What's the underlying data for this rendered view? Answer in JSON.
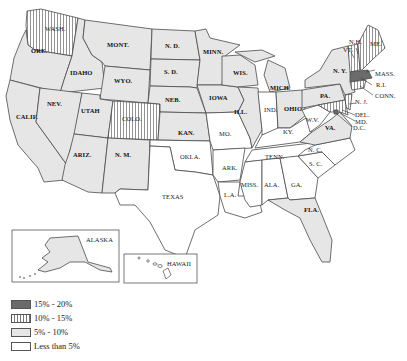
{
  "legend": {
    "items": [
      {
        "label": "15% - 20%",
        "category": "high",
        "fill": "#6b6b6b",
        "pattern": "solid"
      },
      {
        "label": "10% - 15%",
        "category": "mid_high",
        "fill": "#ffffff",
        "pattern": "vertical-stripes"
      },
      {
        "label": "5% - 10%",
        "category": "mid",
        "fill": "#e6e6e6",
        "pattern": "solid"
      },
      {
        "label": "Less than 5%",
        "category": "low",
        "fill": "#ffffff",
        "pattern": "solid"
      }
    ]
  },
  "colors": {
    "high": "#6b6b6b",
    "mid": "#e6e6e6",
    "low": "#ffffff",
    "stripe": "#777777",
    "border": "#4a4a4a"
  },
  "states": [
    {
      "abbr": "WASH.",
      "category": "mid_high",
      "bold": false
    },
    {
      "abbr": "ORE.",
      "category": "mid",
      "bold": true
    },
    {
      "abbr": "CALIF.",
      "category": "mid",
      "bold": true
    },
    {
      "abbr": "IDAHO",
      "category": "mid",
      "bold": true
    },
    {
      "abbr": "NEV.",
      "category": "mid",
      "bold": true
    },
    {
      "abbr": "MONT.",
      "category": "mid",
      "bold": true
    },
    {
      "abbr": "WYO.",
      "category": "mid",
      "bold": true
    },
    {
      "abbr": "UTAH",
      "category": "mid",
      "bold": true
    },
    {
      "abbr": "COLO.",
      "category": "mid_high",
      "bold": false
    },
    {
      "abbr": "ARIZ.",
      "category": "mid",
      "bold": true
    },
    {
      "abbr": "N. M.",
      "category": "mid",
      "bold": true
    },
    {
      "abbr": "N. D.",
      "category": "mid",
      "bold": true
    },
    {
      "abbr": "S. D.",
      "category": "mid",
      "bold": true
    },
    {
      "abbr": "NEB.",
      "category": "mid",
      "bold": true
    },
    {
      "abbr": "KAN.",
      "category": "mid",
      "bold": true
    },
    {
      "abbr": "OKLA.",
      "category": "low",
      "bold": false
    },
    {
      "abbr": "TEXAS",
      "category": "low",
      "bold": false
    },
    {
      "abbr": "MINN.",
      "category": "mid",
      "bold": true
    },
    {
      "abbr": "IOWA",
      "category": "mid",
      "bold": true
    },
    {
      "abbr": "MO.",
      "category": "low",
      "bold": false
    },
    {
      "abbr": "ARK.",
      "category": "low",
      "bold": false
    },
    {
      "abbr": "L.A.",
      "category": "low",
      "bold": false
    },
    {
      "abbr": "WIS.",
      "category": "mid",
      "bold": true
    },
    {
      "abbr": "ILL.",
      "category": "mid",
      "bold": true
    },
    {
      "abbr": "MICH.",
      "category": "mid",
      "bold": true
    },
    {
      "abbr": "IND.",
      "category": "low",
      "bold": false
    },
    {
      "abbr": "OHIO",
      "category": "mid",
      "bold": true
    },
    {
      "abbr": "KY.",
      "category": "low",
      "bold": false
    },
    {
      "abbr": "TENN.",
      "category": "low",
      "bold": false
    },
    {
      "abbr": "MISS.",
      "category": "low",
      "bold": false
    },
    {
      "abbr": "ALA.",
      "category": "low",
      "bold": false
    },
    {
      "abbr": "GA.",
      "category": "low",
      "bold": false
    },
    {
      "abbr": "FLA.",
      "category": "mid",
      "bold": true
    },
    {
      "abbr": "S. C.",
      "category": "low",
      "bold": false
    },
    {
      "abbr": "N. C.",
      "category": "low",
      "bold": false
    },
    {
      "abbr": "VA.",
      "category": "mid",
      "bold": true
    },
    {
      "abbr": "W.V.",
      "category": "low",
      "bold": false
    },
    {
      "abbr": "PA.",
      "category": "mid",
      "bold": true
    },
    {
      "abbr": "N. Y.",
      "category": "mid",
      "bold": true
    },
    {
      "abbr": "N. J.",
      "category": "mid_high",
      "bold": false
    },
    {
      "abbr": "DEL.",
      "category": "mid_high",
      "bold": false
    },
    {
      "abbr": "MD.",
      "category": "mid_high",
      "bold": false
    },
    {
      "abbr": "D.C.",
      "category": "high",
      "bold": false
    },
    {
      "abbr": "CONN.",
      "category": "mid_high",
      "bold": false
    },
    {
      "abbr": "R.I.",
      "category": "mid_high",
      "bold": false
    },
    {
      "abbr": "MASS.",
      "category": "high",
      "bold": false
    },
    {
      "abbr": "VT.",
      "category": "mid_high",
      "bold": false
    },
    {
      "abbr": "N.H.",
      "category": "mid_high",
      "bold": false
    },
    {
      "abbr": "ME.",
      "category": "mid_high",
      "bold": false
    },
    {
      "abbr": "ALASKA",
      "category": "mid",
      "bold": false
    },
    {
      "abbr": "HAWAII",
      "category": "low",
      "bold": false
    }
  ],
  "labels": {
    "wash": "WASH.",
    "ore": "ORE.",
    "calif": "CALIF.",
    "idaho": "IDAHO",
    "nev": "NEV.",
    "mont": "MONT.",
    "wyo": "WYO.",
    "utah": "UTAH",
    "colo": "COLO.",
    "ariz": "ARIZ.",
    "nm": "N. M.",
    "nd": "N. D.",
    "sd": "S. D.",
    "neb": "NEB.",
    "kan": "KAN.",
    "okla": "OKLA.",
    "texas": "TEXAS",
    "minn": "MINN.",
    "iowa": "IOWA",
    "mo": "MO.",
    "ark": "ARK.",
    "la": "L.A.",
    "wis": "WIS.",
    "ill": "ILL.",
    "mich": "MICH.",
    "ind": "IND.",
    "ohio": "OHIO",
    "ky": "KY.",
    "tenn": "TENN.",
    "miss": "MISS.",
    "ala": "ALA.",
    "ga": "GA.",
    "fla": "FLA.",
    "sc": "S. C.",
    "nc": "N. C.",
    "va": "VA.",
    "wv": "W.V.",
    "pa": "PA.",
    "ny": "N. Y.",
    "nj": "N. J.",
    "del": "DEL.",
    "md": "MD.",
    "dc": "D.C.",
    "conn": "CONN.",
    "ri": "R.I.",
    "mass": "MASS.",
    "vt": "VT.",
    "nh": "N.H.",
    "me": "ME.",
    "alaska": "ALASKA",
    "hawaii": "HAWAII"
  }
}
